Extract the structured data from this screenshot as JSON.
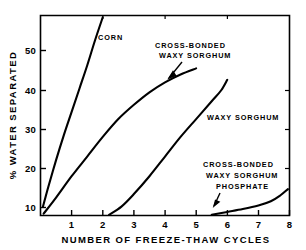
{
  "chart_data": {
    "type": "line",
    "title": "",
    "xlabel": "NUMBER OF FREEZE-THAW CYCLES",
    "ylabel": "% WATER SEPARATED",
    "xlim": [
      0,
      8
    ],
    "ylim": [
      2,
      58
    ],
    "xticks": [
      1,
      2,
      3,
      4,
      5,
      6,
      7,
      8
    ],
    "xtick_labels": [
      "1",
      "2",
      "3",
      "4",
      "5",
      "6",
      "7",
      "8"
    ],
    "yticks": [
      10,
      20,
      30,
      40,
      50
    ],
    "ytick_labels": [
      "10",
      "20",
      "30",
      "40",
      "50"
    ],
    "grid": false,
    "legend": "inline-annotations",
    "series": [
      {
        "name": "CORN",
        "label": "CORN",
        "label_lines": [
          "CORN"
        ],
        "points": [
          {
            "x": 0.08,
            "y": 4.5
          },
          {
            "x": 0.25,
            "y": 10.0
          },
          {
            "x": 0.5,
            "y": 17.5
          },
          {
            "x": 0.75,
            "y": 24.5
          },
          {
            "x": 1.0,
            "y": 31.0
          },
          {
            "x": 1.25,
            "y": 37.5
          },
          {
            "x": 1.5,
            "y": 44.0
          },
          {
            "x": 1.75,
            "y": 51.0
          },
          {
            "x": 2.0,
            "y": 57.5
          }
        ]
      },
      {
        "name": "CROSS-BONDED WAXY SORGHUM",
        "label": "CROSS-BONDED WAXY SORGHUM",
        "label_lines": [
          "CROSS-BONDED",
          "WAXY SORGHUM"
        ],
        "points": [
          {
            "x": 0.1,
            "y": 2.5
          },
          {
            "x": 0.5,
            "y": 7.0
          },
          {
            "x": 1.0,
            "y": 13.0
          },
          {
            "x": 1.5,
            "y": 18.5
          },
          {
            "x": 2.0,
            "y": 24.0
          },
          {
            "x": 2.5,
            "y": 29.0
          },
          {
            "x": 3.0,
            "y": 33.0
          },
          {
            "x": 3.5,
            "y": 36.5
          },
          {
            "x": 4.0,
            "y": 39.3
          },
          {
            "x": 4.5,
            "y": 41.5
          },
          {
            "x": 5.0,
            "y": 43.2
          }
        ]
      },
      {
        "name": "WAXY SORGHUM",
        "label": "WAXY SORGHUM",
        "label_lines": [
          "WAXY SORGHUM"
        ],
        "points": [
          {
            "x": 2.2,
            "y": 2.2
          },
          {
            "x": 2.6,
            "y": 4.5
          },
          {
            "x": 3.0,
            "y": 8.0
          },
          {
            "x": 3.5,
            "y": 13.0
          },
          {
            "x": 4.0,
            "y": 18.5
          },
          {
            "x": 4.5,
            "y": 24.0
          },
          {
            "x": 5.0,
            "y": 29.0
          },
          {
            "x": 5.5,
            "y": 34.0
          },
          {
            "x": 5.8,
            "y": 37.0
          },
          {
            "x": 6.0,
            "y": 40.0
          }
        ]
      },
      {
        "name": "CROSS-BONDED WAXY SORGHUM PHOSPHATE",
        "label": "CROSS-BONDED WAXY SORGHUM PHOSPHATE",
        "label_lines": [
          "CROSS-BONDED",
          "WAXY SORGHUM",
          "PHOSPHATE"
        ],
        "points": [
          {
            "x": 5.5,
            "y": 2.2
          },
          {
            "x": 6.0,
            "y": 3.0
          },
          {
            "x": 6.5,
            "y": 3.8
          },
          {
            "x": 7.0,
            "y": 4.8
          },
          {
            "x": 7.4,
            "y": 6.0
          },
          {
            "x": 7.7,
            "y": 7.6
          },
          {
            "x": 7.95,
            "y": 9.4
          }
        ]
      }
    ],
    "annotations": [
      {
        "name": "corn-label",
        "text": "CORN"
      },
      {
        "name": "cross-bonded-waxy-sorghum-label",
        "text": "CROSS-BONDED WAXY SORGHUM",
        "arrow": true
      },
      {
        "name": "waxy-sorghum-label",
        "text": "WAXY SORGHUM"
      },
      {
        "name": "cross-bonded-waxy-sorghum-phosphate-label",
        "text": "CROSS-BONDED WAXY SORGHUM PHOSPHATE",
        "arrow": true
      }
    ],
    "colors": {
      "line": "#000000",
      "axis": "#000000",
      "background": "#ffffff"
    }
  },
  "axes": {
    "x_title": "NUMBER OF FREEZE-THAW CYCLES",
    "y_title": "% WATER SEPARATED",
    "xticks": [
      "1",
      "2",
      "3",
      "4",
      "5",
      "6",
      "7",
      "8"
    ],
    "yticks": [
      "50",
      "40",
      "30",
      "20",
      "10"
    ]
  },
  "labels": {
    "corn": "CORN",
    "cb_waxy_1": "CROSS-BONDED",
    "cb_waxy_2": "WAXY SORGHUM",
    "waxy": "WAXY SORGHUM",
    "cbp_1": "CROSS-BONDED",
    "cbp_2": "WAXY SORGHUM",
    "cbp_3": "PHOSPHATE"
  }
}
